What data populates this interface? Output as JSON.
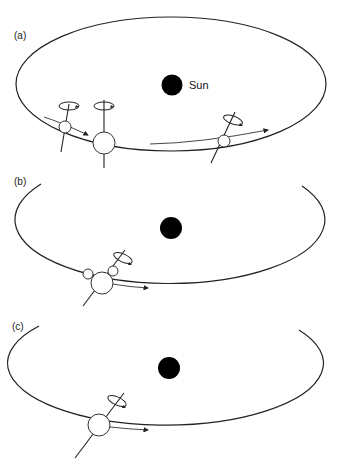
{
  "figure": {
    "header_partial": "",
    "panels": [
      {
        "id": "a",
        "label": "(a)",
        "sun_label": "Sun",
        "description": "Planetesimals with tilted spin axes colliding along orbit around Sun"
      },
      {
        "id": "b",
        "label": "(b)",
        "description": "Protoplanet with two orbiting bodies, tilted spin axis"
      },
      {
        "id": "c",
        "label": "(c)",
        "description": "Single planet with tilted spin axis orbiting Sun"
      }
    ],
    "colors": {
      "line": "#222222",
      "sun": "#000000",
      "background": "#ffffff"
    }
  }
}
